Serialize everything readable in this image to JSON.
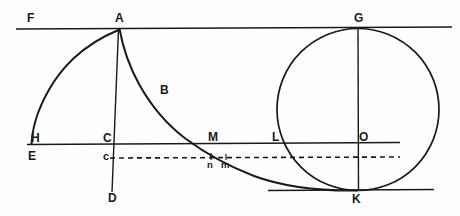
{
  "figure": {
    "width": 460,
    "height": 216,
    "ink_color": "#1a1a1a",
    "background_color": "#fefefe"
  },
  "labels": {
    "F": "F",
    "A": "A",
    "G": "G",
    "B": "B",
    "H": "H",
    "C": "C",
    "M": "M",
    "L": "L",
    "O": "O",
    "E": "E",
    "c_lower": "c",
    "n_lower": "n",
    "m_lower": "m",
    "D": "D",
    "K": "K"
  },
  "points": [
    {
      "name": "F",
      "x": 28,
      "y": 20,
      "kind": "label-only"
    },
    {
      "name": "A",
      "x": 119,
      "y": 28,
      "kind": "cusp"
    },
    {
      "name": "G",
      "x": 358,
      "y": 28,
      "kind": "circle-top"
    },
    {
      "name": "B",
      "x": 163,
      "y": 88,
      "kind": "curve-label"
    },
    {
      "name": "H",
      "x": 32,
      "y": 143,
      "kind": "arc-end"
    },
    {
      "name": "C",
      "x": 110,
      "y": 143,
      "kind": "intersection"
    },
    {
      "name": "M",
      "x": 212,
      "y": 143,
      "kind": "intersection"
    },
    {
      "name": "L",
      "x": 277,
      "y": 143,
      "kind": "intersection"
    },
    {
      "name": "O",
      "x": 358,
      "y": 143,
      "kind": "circle-center"
    },
    {
      "name": "E",
      "x": 30,
      "y": 158,
      "kind": "label-only"
    },
    {
      "name": "c",
      "x": 110,
      "y": 158,
      "kind": "dashed-start"
    },
    {
      "name": "n",
      "x": 210,
      "y": 165,
      "kind": "intersection"
    },
    {
      "name": "m",
      "x": 226,
      "y": 165,
      "kind": "intersection"
    },
    {
      "name": "D",
      "x": 110,
      "y": 196,
      "kind": "line-end"
    },
    {
      "name": "K",
      "x": 358,
      "y": 190,
      "kind": "circle-bottom"
    }
  ],
  "geometry": {
    "top_line": {
      "name": "FAG-line",
      "x1": 16,
      "y1": 29,
      "x2": 452,
      "y2": 27
    },
    "mid_line": {
      "name": "HCMLO-line",
      "x1": 27,
      "y1": 144,
      "x2": 400,
      "y2": 142
    },
    "dashed_line": {
      "name": "c-to-right-dashed",
      "x1": 110,
      "y1": 158,
      "x2": 400,
      "y2": 157,
      "dash": "5,4"
    },
    "bottom_line": {
      "name": "K-baseline",
      "x1": 268,
      "y1": 190,
      "x2": 434,
      "y2": 189
    },
    "vertical_ACD": {
      "name": "A-C-D-vertical",
      "x1": 119,
      "y1": 28,
      "x2": 112,
      "y2": 192
    },
    "vertical_GOK": {
      "name": "G-O-K-vertical",
      "x1": 358,
      "y1": 28,
      "x2": 358,
      "y2": 191
    },
    "circle": {
      "name": "generating-circle",
      "cx": 358,
      "cy": 109,
      "r": 81
    },
    "curve_right": {
      "name": "cycloid-ABMK",
      "from": "A",
      "through": [
        "B",
        "M",
        "m"
      ],
      "to": "K"
    },
    "curve_left": {
      "name": "arc-AH",
      "from": "A",
      "to": "H"
    }
  }
}
